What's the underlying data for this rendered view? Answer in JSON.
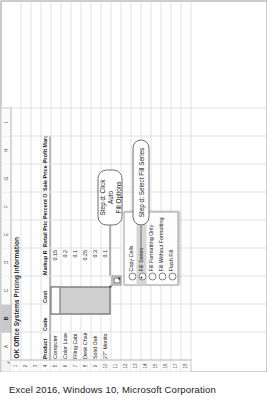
{
  "caption": "Excel 2016, Windows 10, Microsoft Corporation",
  "spreadsheet": {
    "title": "OK Office Systems Pricing Information",
    "title_cell": "A1",
    "column_letters": [
      "A",
      "B",
      "C",
      "D",
      "E",
      "F",
      "G",
      "H",
      "I"
    ],
    "selected_column": "B",
    "row_numbers": [
      "1",
      "2",
      "3",
      "4",
      "5",
      "6",
      "7",
      "8",
      "9",
      "10",
      "11",
      "12",
      "13",
      "14",
      "15",
      "16",
      "17",
      "18"
    ],
    "headers": {
      "row": "4",
      "labels": [
        "Product",
        "Code",
        "Cost",
        "Markup R",
        "Retail Pric",
        "Percent O",
        "Sale Price",
        "Profit Margin"
      ]
    },
    "rows": [
      {
        "row": "5",
        "product": "Computer",
        "code": "101",
        "markup": "0.15"
      },
      {
        "row": "6",
        "product": "Color Lase",
        "code": "102",
        "markup": "0.2"
      },
      {
        "row": "7",
        "product": "Filing Cabi",
        "code": "103",
        "markup": "0.1"
      },
      {
        "row": "8",
        "product": "Desk Chair",
        "code": "104",
        "markup": "0.25"
      },
      {
        "row": "9",
        "product": "Solid Oak",
        "code": "105",
        "markup": "0.3"
      },
      {
        "row": "10",
        "product": "27\" Monito",
        "code": "106",
        "markup": "0.1"
      }
    ],
    "selection_range": "B5:B10",
    "autofill_button": "auto-fill-options-button"
  },
  "context_menu": {
    "items": [
      {
        "label": "Copy Cells",
        "selected": false,
        "checked": false
      },
      {
        "label": "Fill Series",
        "selected": true,
        "checked": true
      },
      {
        "label": "Fill Formatting Only",
        "selected": false,
        "checked": false
      },
      {
        "label": "Fill Without Formatting",
        "selected": false,
        "checked": false
      },
      {
        "label": "Flash Fill",
        "selected": false,
        "checked": false
      }
    ]
  },
  "callouts": [
    {
      "id": "callout-auto-fill-options",
      "line1": "Step d: Click Auto",
      "line2": "Fill Options"
    },
    {
      "id": "callout-select-fill-series",
      "line1": "Step d: Select Fill Series",
      "line2": ""
    }
  ],
  "colors": {
    "selection_fill": "#cfcfcf",
    "selection_border": "#5d5d5d",
    "menu_highlight": "#d6d6d6",
    "grid_line": "#e2e2e2",
    "header_bg": "#fbfbfb"
  }
}
